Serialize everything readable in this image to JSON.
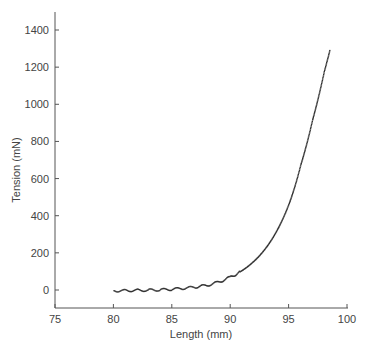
{
  "chart_data": {
    "type": "scatter",
    "title": "",
    "xlabel": "Length (mm)",
    "ylabel": "Tension (mN)",
    "xlim": [
      75,
      100
    ],
    "ylim": [
      -90,
      1500
    ],
    "xticks": [
      75,
      80,
      85,
      90,
      95,
      100
    ],
    "yticks": [
      0,
      200,
      400,
      600,
      800,
      1000,
      1200,
      1400
    ],
    "grid": false,
    "legend": null,
    "series": [
      {
        "name": "tension-length",
        "x": [
          80,
          81,
          82,
          83,
          84,
          85,
          86,
          87,
          88,
          89,
          90,
          91,
          92,
          93,
          94,
          95,
          96,
          97,
          98,
          98.5
        ],
        "y": [
          0,
          1,
          2,
          3,
          5,
          8,
          13,
          20,
          30,
          48,
          75,
          110,
          160,
          230,
          330,
          470,
          680,
          920,
          1180,
          1300
        ]
      }
    ]
  }
}
